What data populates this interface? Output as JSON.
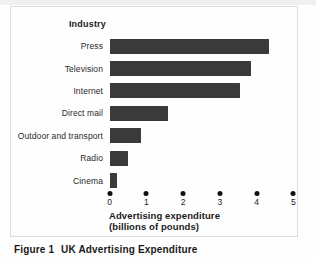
{
  "figure": {
    "caption_prefix": "Figure 1",
    "caption_title": "UK Advertising Expenditure"
  },
  "chart_data": {
    "type": "bar",
    "orientation": "horizontal",
    "column_header": "Industry",
    "categories": [
      "Press",
      "Television",
      "Internet",
      "Direct mail",
      "Outdoor and transport",
      "Radio",
      "Cinema"
    ],
    "values": [
      4.35,
      3.85,
      3.55,
      1.6,
      0.85,
      0.5,
      0.2
    ],
    "x_ticks": [
      "0",
      "1",
      "2",
      "3",
      "4",
      "5"
    ],
    "xlim": [
      0,
      5
    ],
    "xlabel_line1": "Advertising expenditure",
    "xlabel_line2": "(billions of pounds)",
    "bar_color": "#3a3a3a",
    "tick_style": "dot",
    "grid": false
  }
}
